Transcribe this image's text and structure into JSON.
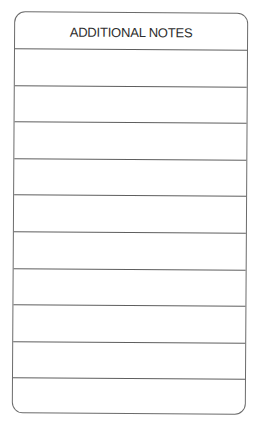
{
  "form": {
    "title": "ADDITIONAL NOTES",
    "line_count": 10,
    "line_spacing_px": 36.6,
    "colors": {
      "border": "#6b6b6b",
      "rule": "#5e5e5e",
      "text": "#2e2e2e",
      "background": "#ffffff"
    }
  },
  "rows": [
    {
      "text": ""
    },
    {
      "text": ""
    },
    {
      "text": ""
    },
    {
      "text": ""
    },
    {
      "text": ""
    },
    {
      "text": ""
    },
    {
      "text": ""
    },
    {
      "text": ""
    },
    {
      "text": ""
    },
    {
      "text": ""
    }
  ]
}
